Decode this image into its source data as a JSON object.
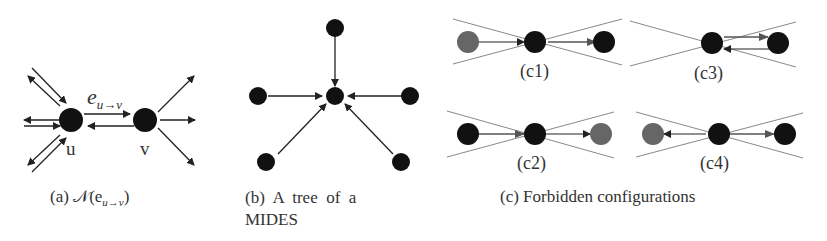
{
  "panels": {
    "a": {
      "caption_prefix": "(a)",
      "caption_math": "𝒩(e",
      "caption_sub": "u→v",
      "caption_close": ")",
      "edge_label": "e",
      "edge_label_sub": "u→v",
      "node_u": "u",
      "node_v": "v"
    },
    "b": {
      "caption_line1": "(b)  A  tree  of  a",
      "caption_line2": "MIDES"
    },
    "c": {
      "caption": "(c) Forbidden configurations",
      "sub": [
        "(c1)",
        "(c3)",
        "(c2)",
        "(c4)"
      ]
    }
  },
  "colors": {
    "node_black": "#111111",
    "node_gray": "#666666",
    "edge": "#333333",
    "cross": "#888888",
    "text": "#333333"
  }
}
